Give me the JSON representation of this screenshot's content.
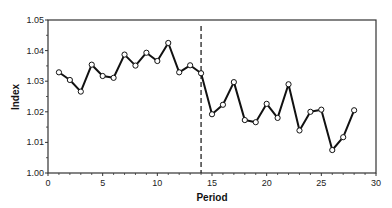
{
  "chart_data": {
    "type": "line",
    "title": "",
    "xlabel": "Period",
    "ylabel": "Index",
    "xlim": [
      0,
      30
    ],
    "ylim": [
      1.0,
      1.05
    ],
    "x_ticks": [
      0,
      5,
      10,
      15,
      20,
      25,
      30
    ],
    "x_tick_labels": [
      "0",
      "5",
      "10",
      "15",
      "20",
      "25",
      "30"
    ],
    "y_ticks": [
      1.0,
      1.01,
      1.02,
      1.03,
      1.04,
      1.05
    ],
    "y_tick_labels": [
      "1.00",
      "1.01",
      "1.02",
      "1.03",
      "1.04",
      "1.05"
    ],
    "grid": false,
    "legend": null,
    "series": [
      {
        "name": "Index",
        "marker": "open-circle",
        "color": "#111111",
        "x": [
          1,
          2,
          3,
          4,
          5,
          6,
          7,
          8,
          9,
          10,
          11,
          12,
          13,
          14,
          15,
          16,
          17,
          18,
          19,
          20,
          21,
          22,
          23,
          24,
          25,
          26,
          27,
          28
        ],
        "values": [
          1.0329,
          1.0304,
          1.0266,
          1.0354,
          1.0317,
          1.0311,
          1.0387,
          1.0351,
          1.0393,
          1.0366,
          1.0425,
          1.0329,
          1.0352,
          1.0326,
          1.0192,
          1.0223,
          1.0297,
          1.0173,
          1.0166,
          1.0226,
          1.018,
          1.029,
          1.0139,
          1.02,
          1.0207,
          1.0075,
          1.0117,
          1.0205
        ]
      }
    ],
    "annotations": [
      {
        "type": "vertical-dashed-line",
        "x": 14
      }
    ]
  }
}
